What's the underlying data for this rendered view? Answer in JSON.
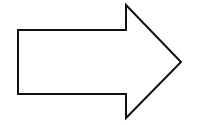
{
  "diagram": {
    "shape": "right-arrow",
    "stroke_color": "#111111",
    "fill_color": "#ffffff",
    "points": "18,30 126,30 126,5 181,62 126,118 126,94 18,94"
  }
}
